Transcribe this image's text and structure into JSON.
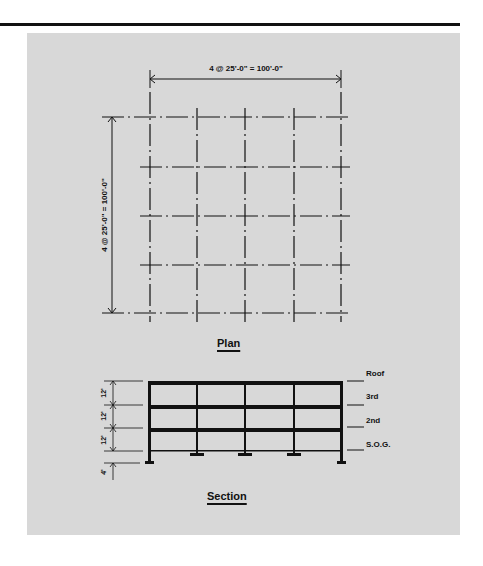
{
  "plan": {
    "title": "Plan",
    "dimension_horizontal": "4 @ 25'-0\" = 100'-0\"",
    "dimension_vertical": "4 @ 25'-0\" = 100'-0\"",
    "grid_bays_x": 4,
    "grid_bays_y": 4
  },
  "section": {
    "title": "Section",
    "levels": [
      {
        "label": "Roof"
      },
      {
        "label": "3rd"
      },
      {
        "label": "2nd"
      },
      {
        "label": "S.O.G."
      }
    ],
    "story_heights": [
      "12'",
      "12'",
      "12'"
    ],
    "foundation_depth": "4'"
  },
  "colors": {
    "panel": "#d8d8d8",
    "ink": "#111111"
  }
}
